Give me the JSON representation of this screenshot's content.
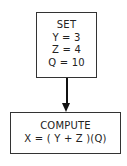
{
  "diagram": {
    "type": "flowchart",
    "nodes": [
      {
        "id": "set",
        "lines": [
          "SET",
          "Y = 3",
          "Z = 4",
          "Q = 10"
        ]
      },
      {
        "id": "compute",
        "lines": [
          "COMPUTE",
          "X = ( Y + Z )(Q)"
        ]
      }
    ],
    "edges": [
      {
        "from": "set",
        "to": "compute",
        "style": "arrow"
      }
    ]
  }
}
